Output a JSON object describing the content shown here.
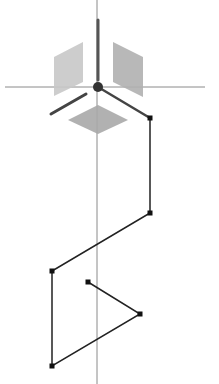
{
  "canvas": {
    "width": 219,
    "height": 384,
    "background": "#ffffff"
  },
  "axes": {
    "color": "#8a8a8a",
    "horizontal": {
      "x1": 5,
      "y1": 87,
      "x2": 205,
      "y2": 87
    },
    "vertical": {
      "x1": 97,
      "y1": 0,
      "x2": 97,
      "y2": 384
    }
  },
  "gizmo": {
    "hub": {
      "cx": 98,
      "cy": 87,
      "r": 5,
      "color": "#333333"
    },
    "planes": [
      {
        "name": "left-plane",
        "points": "54,57 83,42 83,82 54,96",
        "fill": "#c8c8c8"
      },
      {
        "name": "right-plane",
        "points": "113,42 143,57 143,97 113,82",
        "fill": "#b0b0b0"
      },
      {
        "name": "bottom-plane",
        "points": "98,105 128,120 98,134 68,120",
        "fill": "#a8a8a8"
      }
    ],
    "handles": [
      {
        "name": "vertical-handle",
        "x1": 98,
        "y1": 20,
        "x2": 98,
        "y2": 80,
        "color": "#555555",
        "width": 3
      },
      {
        "name": "left-handle",
        "x1": 51,
        "y1": 114,
        "x2": 86,
        "y2": 94,
        "color": "#444444",
        "width": 3
      },
      {
        "name": "right-handle",
        "x1": 98,
        "y1": 87,
        "x2": 150,
        "y2": 118,
        "color": "#444444",
        "width": 2.5
      }
    ]
  },
  "path": {
    "color": "#222222",
    "points": [
      {
        "x": 150,
        "y": 118
      },
      {
        "x": 150,
        "y": 213
      },
      {
        "x": 52,
        "y": 271
      },
      {
        "x": 52,
        "y": 366
      },
      {
        "x": 140,
        "y": 314
      },
      {
        "x": 88,
        "y": 282
      }
    ]
  }
}
